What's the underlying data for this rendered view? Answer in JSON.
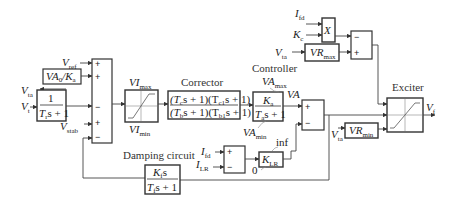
{
  "diagram": {
    "type": "excitation-system-block-diagram",
    "labels": {
      "corrector": "Corrector",
      "controller": "Controller",
      "exciter": "Exciter",
      "damping_circuit": "Damping circuit"
    },
    "signals": {
      "vref": "V",
      "vref_sub": "ref",
      "vta": "V",
      "vta_sub": "ta",
      "vt": "V",
      "vt_sub": "t",
      "vstab": "V",
      "vstab_sub": "stab",
      "vf": "V",
      "vf_sub": "f",
      "ifd": "I",
      "ifd_sub": "fd",
      "ilr": "I",
      "ilr_sub": "LR",
      "kc": "K",
      "kc_sub": "c",
      "va": "VA"
    },
    "blocks": {
      "va0_ka": {
        "num": "VA",
        "num_sub": "0",
        "mid": "/K",
        "mid_sub": "a"
      },
      "transducer": {
        "num": "1",
        "den": "T",
        "den_sub": "r",
        "den_rest": "s + 1"
      },
      "vi_limiter": {
        "max": "VI",
        "max_sub": "max",
        "min": "VI",
        "min_sub": "min"
      },
      "corrector": {
        "num": "(Tₐs + 1)(Tᶜ₁s + 1)",
        "num_a": "(T",
        "num_a_sub": "c",
        "num_b": "s + 1)(T",
        "num_b_sub": "c1",
        "num_c": "s + 1)",
        "den_a": "(T",
        "den_a_sub": "b",
        "den_b": "s + 1)(T",
        "den_b_sub": "b1",
        "den_c": "s + 1)"
      },
      "controller": {
        "num": "K",
        "num_sub": "a",
        "den": "T",
        "den_sub": "a",
        "den_rest": "s + 1",
        "max": "VA",
        "max_sub": "max",
        "min": "VA",
        "min_sub": "min"
      },
      "multiplier": {
        "label": "X"
      },
      "vr_max": {
        "label": "VR",
        "sub": "max"
      },
      "vr_min": {
        "label": "VR",
        "sub": "min"
      },
      "klr": {
        "label": "K",
        "sub": "LR",
        "upper": "inf",
        "lower": "0"
      },
      "damping": {
        "num": "K",
        "num_sub": "f",
        "num_rest": "s",
        "den": "T",
        "den_sub": "f",
        "den_rest": "s + 1"
      }
    },
    "summing_junction_main": {
      "signs": [
        "+",
        "+",
        "−",
        "+",
        "−"
      ]
    },
    "summing_junction_va": {
      "signs": [
        "+",
        "−"
      ]
    },
    "summing_junction_top": {
      "signs": [
        "−",
        "+"
      ]
    },
    "summing_junction_ilr": {
      "signs": [
        "+",
        "−"
      ]
    }
  }
}
